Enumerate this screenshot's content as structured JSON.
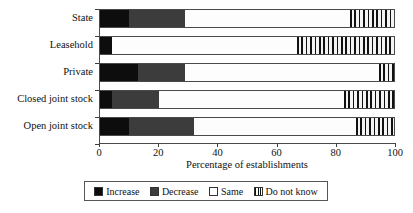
{
  "chart_data": {
    "type": "bar",
    "orientation": "horizontal",
    "stacked": true,
    "title": "",
    "xlabel": "Percentage of establishments",
    "ylabel": "",
    "xlim": [
      0,
      100
    ],
    "xticks": [
      0,
      20,
      40,
      60,
      80,
      100
    ],
    "xtick_labels": [
      "0",
      "20",
      "40",
      "60",
      "80",
      "100"
    ],
    "grid": false,
    "legend_position": "bottom",
    "categories": [
      "State",
      "Leasehold",
      "Private",
      "Closed joint stock",
      "Open joint stock"
    ],
    "series": [
      {
        "name": "Increase",
        "values": [
          10,
          4,
          13,
          4,
          10
        ]
      },
      {
        "name": "Decrease",
        "values": [
          19,
          0,
          16,
          16,
          22
        ]
      },
      {
        "name": "Same",
        "values": [
          56,
          63,
          66,
          63,
          55
        ]
      },
      {
        "name": "Do not know",
        "values": [
          15,
          33,
          5,
          17,
          13
        ]
      }
    ],
    "legend": [
      {
        "label": "Increase",
        "swatch": "solid-black"
      },
      {
        "label": "Decrease",
        "swatch": "solid-dark-gray"
      },
      {
        "label": "Same",
        "swatch": "white"
      },
      {
        "label": "Do not know",
        "swatch": "vertical-hatch"
      }
    ],
    "colors": {
      "increase": "#0d0d0d",
      "decrease": "#3c3c3c",
      "same": "#ffffff",
      "do_not_know": "#111111",
      "axis": "#4a4a4a",
      "text": "#111111"
    }
  }
}
